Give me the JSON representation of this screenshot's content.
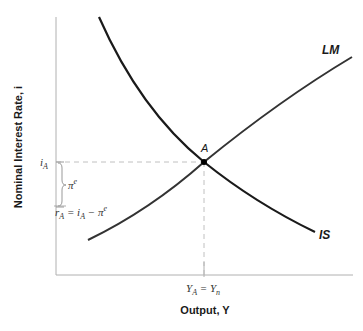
{
  "diagram": {
    "type": "IS-LM",
    "y_axis_title": "Nominal Interest Rate, i",
    "x_axis_title": "Output, Y",
    "curves": [
      {
        "name": "IS",
        "label": "IS",
        "slope": "downward"
      },
      {
        "name": "LM",
        "label": "LM",
        "slope": "upward"
      }
    ],
    "equilibrium_point": {
      "label": "A"
    },
    "y_labels": {
      "nominal_rate": {
        "base": "i",
        "sub": "A"
      },
      "expected_inflation": {
        "base": "π",
        "sup": "e"
      },
      "real_rate": {
        "base": "r",
        "sub": "A",
        "eq": " = ",
        "rhs_base": "i",
        "rhs_sub": "A",
        "minus": " − ",
        "pi": "π",
        "pi_sup": "e"
      }
    },
    "x_label": {
      "base": "Y",
      "sub": "A",
      "eq": " = ",
      "rhs_base": "Y",
      "rhs_sub": "n"
    },
    "colors": {
      "curve": "#1a1a1a",
      "axis": "#b0b0b0",
      "dashed": "#c0c0c0",
      "brace": "#999999"
    }
  }
}
